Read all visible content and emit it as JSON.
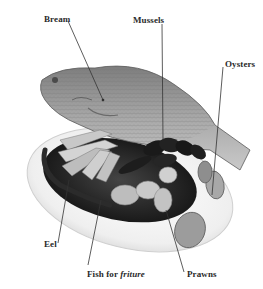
{
  "figure": {
    "labels": [
      {
        "id": "bream",
        "text": "Bream",
        "x": 44,
        "y": 14
      },
      {
        "id": "mussels",
        "text": "Mussels",
        "x": 133,
        "y": 15
      },
      {
        "id": "oysters",
        "text": "Oysters",
        "x": 225,
        "y": 59
      },
      {
        "id": "eel",
        "text": "Eel",
        "x": 44,
        "y": 239
      },
      {
        "id": "fish-for-friture",
        "text_plain": "Fish for ",
        "text_italic": "friture",
        "x": 87,
        "y": 269
      },
      {
        "id": "prawns",
        "text": "Prawns",
        "x": 187,
        "y": 269
      }
    ],
    "leader_lines": [
      {
        "to": "bream",
        "x1": 68,
        "y1": 21,
        "x2": 103,
        "y2": 100
      },
      {
        "to": "mussels",
        "x1": 162,
        "y1": 24,
        "x2": 163,
        "y2": 140
      },
      {
        "to": "oysters",
        "x1": 223,
        "y1": 67,
        "x2": 212,
        "y2": 195
      },
      {
        "to": "eel",
        "x1": 58,
        "y1": 243,
        "x2": 69,
        "y2": 180
      },
      {
        "to": "fish-for-friture",
        "x1": 88,
        "y1": 265,
        "x2": 101,
        "y2": 200
      },
      {
        "to": "prawns",
        "x1": 184,
        "y1": 272,
        "x2": 166,
        "y2": 210
      }
    ],
    "colors": {
      "background": "#ffffff",
      "label_text": "#2a2a2a",
      "leader_line": "#333333",
      "plate": "#f2f2f2",
      "dish_dark": "#1e1e1e",
      "fish_body": "#9a9a9a"
    }
  }
}
